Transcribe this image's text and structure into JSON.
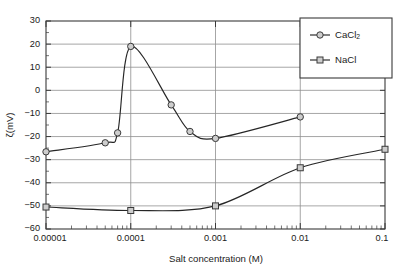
{
  "chart_data": {
    "type": "line",
    "title": "",
    "xlabel": "Salt concentration (M)",
    "ylabel": "ζ(mV)",
    "xscale": "log",
    "xlim": [
      1e-05,
      0.1
    ],
    "ylim": [
      -60,
      30
    ],
    "ytick_step": 10,
    "grid": "horizontal",
    "legend_position": "top-right",
    "xticklabels": [
      "0.00001",
      "0.0001",
      "0.001",
      "0.01",
      "0.1"
    ],
    "xtickvalues": [
      1e-05,
      0.0001,
      0.001,
      0.01,
      0.1
    ],
    "yticklabels": [
      "30",
      "20",
      "10",
      "0",
      "−10",
      "−20",
      "−30",
      "−40",
      "−50",
      "−60"
    ],
    "ytickvalues": [
      30,
      20,
      10,
      0,
      -10,
      -20,
      -30,
      -40,
      -50,
      -60
    ],
    "series": [
      {
        "name": "CaCl2",
        "label": "CaCl",
        "label_sub": "2",
        "marker": "circle",
        "x": [
          1e-05,
          5e-05,
          7e-05,
          0.0001,
          0.0003,
          0.0005,
          0.001,
          0.01
        ],
        "values": [
          -26.6,
          -22.7,
          -18.4,
          19.0,
          -6.3,
          -17.8,
          -20.8,
          -11.5
        ]
      },
      {
        "name": "NaCl",
        "label": "NaCl",
        "label_sub": "",
        "marker": "square",
        "x": [
          1e-05,
          0.0001,
          0.001,
          0.01,
          0.1
        ],
        "values": [
          -50.5,
          -52.0,
          -50.0,
          -33.5,
          -25.5
        ]
      }
    ],
    "colors": {
      "line": "#262626",
      "marker_fill": "#cdcdcd",
      "marker_edge": "#3a3a3a",
      "grid": "#8f8f8f",
      "axis": "#3a3a3a",
      "background": "#ffffff"
    }
  }
}
